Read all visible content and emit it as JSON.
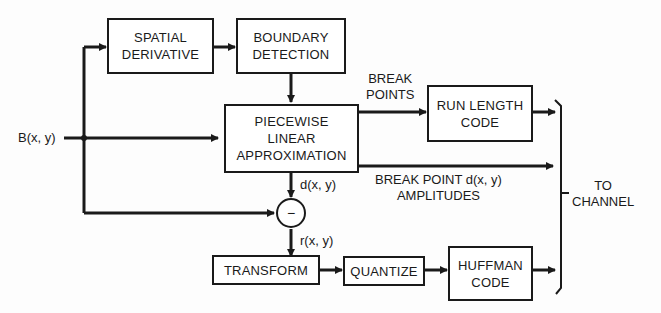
{
  "diagram": {
    "input_label": "B(x, y)",
    "blocks": {
      "spatial_derivative": "SPATIAL\nDERIVATIVE",
      "boundary_detection": "BOUNDARY\nDETECTION",
      "piecewise_linear": "PIECEWISE\nLINEAR\nAPPROXIMATION",
      "run_length": "RUN LENGTH\nCODE",
      "transform": "TRANSFORM",
      "quantize": "QUANTIZE",
      "huffman": "HUFFMAN\nCODE"
    },
    "subtractor_symbol": "−",
    "labels": {
      "break_points": "BREAK\nPOINTS",
      "break_point_amplitudes": "BREAK POINT d(x, y)\nAMPLITUDES",
      "d_signal": "d(x, y)",
      "r_signal": "r(x, y)",
      "to_channel": "TO\nCHANNEL"
    }
  }
}
